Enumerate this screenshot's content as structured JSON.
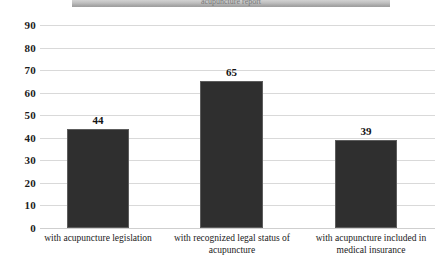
{
  "banner": {
    "text": "acupuncture report"
  },
  "chart_data": {
    "type": "bar",
    "title": "",
    "subtitle": "",
    "xlabel": "",
    "ylabel": "",
    "categories": [
      "with acupuncture legislation",
      "with recognized legal status of acupuncture",
      "with acupuncture included in medical insurance"
    ],
    "category_lines": [
      [
        "with acupuncture legislation"
      ],
      [
        "with recognized legal status of",
        "acupuncture"
      ],
      [
        "with acupuncture included in",
        "medical insurance"
      ]
    ],
    "values": [
      44,
      65,
      39
    ],
    "value_labels": [
      "44",
      "65",
      "39"
    ],
    "ylim": [
      0,
      90
    ],
    "ytick_step": 10,
    "yticks": [
      90,
      80,
      70,
      60,
      50,
      40,
      30,
      20,
      10,
      0
    ],
    "ytick_labels": [
      "90",
      "80",
      "70",
      "60",
      "50",
      "40",
      "30",
      "20",
      "10",
      "0"
    ],
    "grid": true,
    "grid_axis": "y",
    "legend": false,
    "legend_position": "none",
    "bar_color": "#2f2f2f",
    "bar_edge_color": "#5d5d5d",
    "gridline_color": "#d9d9d9",
    "text_color": "#1a1a1a",
    "background_color": "#ffffff"
  }
}
